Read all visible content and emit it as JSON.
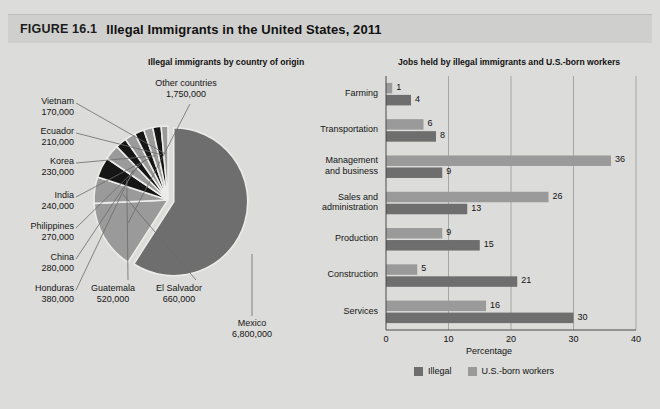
{
  "figure": {
    "number": "FIGURE 16.1",
    "title": "Illegal Immigrants in the United States, 2011"
  },
  "colors": {
    "dark": "#6e6e6e",
    "light": "#9a9a9a",
    "black": "#161616",
    "page_bg": "#dcdcda",
    "header_bg": "#cfcfcd",
    "divider": "#6b6b6b"
  },
  "pie_panel": {
    "subtitle": "Illegal immigrants by country of origin"
  },
  "bar_panel": {
    "subtitle": "Jobs held by illegal immigrants and U.S.-born workers"
  },
  "legend": {
    "items": [
      {
        "label": "Illegal",
        "color": "#6e6e6e"
      },
      {
        "label": "U.S.-born workers",
        "color": "#9a9a9a"
      }
    ]
  },
  "chart_data": [
    {
      "type": "pie",
      "title": "Illegal immigrants by country of origin",
      "unit": "people",
      "labels": [
        "Mexico",
        "Other countries",
        "El Salvador",
        "Guatemala",
        "Honduras",
        "China",
        "Philippines",
        "India",
        "Korea",
        "Ecuador",
        "Vietnam"
      ],
      "values": [
        6800000,
        1750000,
        660000,
        520000,
        380000,
        280000,
        270000,
        240000,
        230000,
        210000,
        170000
      ],
      "value_labels": [
        "6,800,000",
        "1,750,000",
        "660,000",
        "520,000",
        "380,000",
        "280,000",
        "270,000",
        "240,000",
        "230,000",
        "210,000",
        "170,000"
      ],
      "exploded": [
        "Mexico"
      ],
      "legend": "none"
    },
    {
      "type": "bar",
      "orientation": "horizontal",
      "title": "Jobs held by illegal immigrants and U.S.-born workers",
      "xlabel": "Percentage",
      "ylabel": "",
      "xlim": [
        0,
        40
      ],
      "xticks": [
        0,
        10,
        20,
        30,
        40
      ],
      "xtick_labels": [
        "0",
        "10",
        "20",
        "30",
        "40"
      ],
      "grid": true,
      "legend_position": "bottom",
      "categories": [
        "Farming",
        "Transportation",
        "Management and business",
        "Sales and administration",
        "Production",
        "Construction",
        "Services"
      ],
      "series": [
        {
          "name": "U.S.-born workers",
          "color": "#9a9a9a",
          "values": [
            1,
            6,
            36,
            26,
            9,
            5,
            16
          ]
        },
        {
          "name": "Illegal",
          "color": "#6e6e6e",
          "values": [
            4,
            8,
            9,
            13,
            15,
            21,
            30
          ]
        }
      ]
    }
  ]
}
